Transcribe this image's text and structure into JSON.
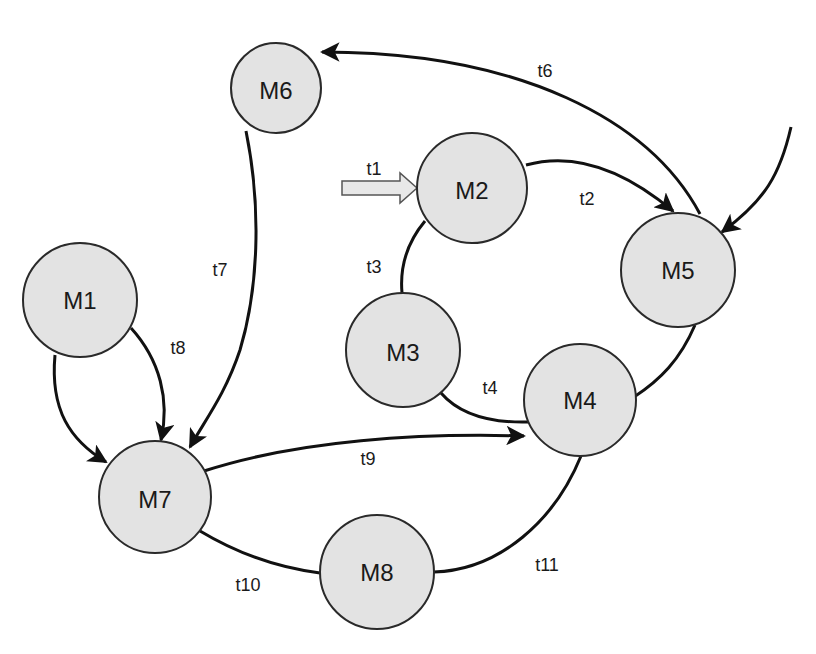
{
  "diagram": {
    "type": "state-transition-graph",
    "colors": {
      "node_fill": "#e3e3e3",
      "node_stroke": "#2a2a2a",
      "edge": "#111111",
      "background": "#ffffff",
      "entry_arrow_fill": "#e8e8e8"
    },
    "nodes": [
      {
        "id": "M1",
        "label": "M1",
        "cx": 80,
        "cy": 300,
        "r": 57
      },
      {
        "id": "M2",
        "label": "M2",
        "cx": 472,
        "cy": 188,
        "r": 55
      },
      {
        "id": "M3",
        "label": "M3",
        "cx": 403,
        "cy": 350,
        "r": 57
      },
      {
        "id": "M4",
        "label": "M4",
        "cx": 580,
        "cy": 400,
        "r": 56
      },
      {
        "id": "M5",
        "label": "M5",
        "cx": 678,
        "cy": 270,
        "r": 57
      },
      {
        "id": "M6",
        "label": "M6",
        "cx": 276,
        "cy": 88,
        "r": 45
      },
      {
        "id": "M7",
        "label": "M7",
        "cx": 155,
        "cy": 497,
        "r": 56
      },
      {
        "id": "M8",
        "label": "M8",
        "cx": 377,
        "cy": 572,
        "r": 57
      }
    ],
    "edges": [
      {
        "id": "t1",
        "label": "t1",
        "from": "(external)",
        "to": "M2",
        "style": "hollow-block-arrow"
      },
      {
        "id": "t2",
        "label": "t2",
        "from": "M2",
        "to": "M5",
        "directed": true
      },
      {
        "id": "t3",
        "label": "t3",
        "from": "M2",
        "to": "M3",
        "directed": false
      },
      {
        "id": "t4",
        "label": "t4",
        "from": "M3",
        "to": "M4",
        "directed": false
      },
      {
        "id": "t5",
        "label": "",
        "from": "M4",
        "to": "M5",
        "directed": false
      },
      {
        "id": "t6",
        "label": "t6",
        "from": "M5",
        "to": "M6",
        "directed": true
      },
      {
        "id": "t7",
        "label": "t7",
        "from": "M6",
        "to": "M7",
        "directed": true
      },
      {
        "id": "t8",
        "label": "t8",
        "from": "M1",
        "to": "M7",
        "directed": true
      },
      {
        "id": "t8b",
        "label": "",
        "from": "M1",
        "to": "M7",
        "directed": true
      },
      {
        "id": "t9",
        "label": "t9",
        "from": "M7",
        "to": "M4",
        "directed": true
      },
      {
        "id": "t10",
        "label": "t10",
        "from": "M7",
        "to": "M8",
        "directed": false
      },
      {
        "id": "t11",
        "label": "t11",
        "from": "M8",
        "to": "M4",
        "directed": false
      },
      {
        "id": "in5",
        "label": "",
        "from": "(external)",
        "to": "M5",
        "directed": true
      }
    ],
    "edge_labels": {
      "t1": "t1",
      "t2": "t2",
      "t3": "t3",
      "t4": "t4",
      "t6": "t6",
      "t7": "t7",
      "t8": "t8",
      "t9": "t9",
      "t10": "t10",
      "t11": "t11"
    }
  }
}
